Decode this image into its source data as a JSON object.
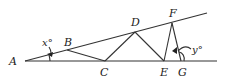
{
  "diagram": {
    "type": "geometry",
    "points": {
      "A": {
        "label": "A",
        "x": 25,
        "y": 61
      },
      "B": {
        "label": "B",
        "x": 67,
        "y": 49
      },
      "C": {
        "label": "C",
        "x": 105,
        "y": 61
      },
      "D": {
        "label": "D",
        "x": 135,
        "y": 31
      },
      "E": {
        "label": "E",
        "x": 164,
        "y": 61
      },
      "F": {
        "label": "F",
        "x": 172,
        "y": 22
      },
      "G": {
        "label": "G",
        "x": 181,
        "y": 61
      }
    },
    "angles": {
      "x": {
        "label": "x°",
        "vertex": "A"
      },
      "y": {
        "label": "y°",
        "vertex": "G"
      }
    },
    "segments": [
      "A-upper",
      "A-baseline",
      "B-C",
      "C-D",
      "D-E",
      "E-F",
      "F-G"
    ]
  }
}
